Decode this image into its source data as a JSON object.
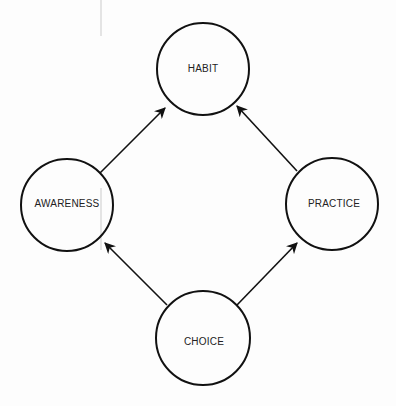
{
  "diagram": {
    "nodes": [
      {
        "id": "habit",
        "label": "HABIT",
        "cx": 203,
        "cy": 69,
        "r": 46
      },
      {
        "id": "awareness",
        "label": "AWARENESS",
        "cx": 67,
        "cy": 205,
        "r": 46
      },
      {
        "id": "practice",
        "label": "PRACTICE",
        "cx": 332,
        "cy": 204,
        "r": 46
      },
      {
        "id": "choice",
        "label": "CHOICE",
        "cx": 203,
        "cy": 338,
        "r": 47
      }
    ],
    "edges": [
      {
        "from": "awareness",
        "to": "habit"
      },
      {
        "from": "practice",
        "to": "habit"
      },
      {
        "from": "choice",
        "to": "awareness"
      },
      {
        "from": "choice",
        "to": "practice"
      }
    ],
    "colors": {
      "stroke": "#111111",
      "background": "#fdfdfd"
    }
  }
}
